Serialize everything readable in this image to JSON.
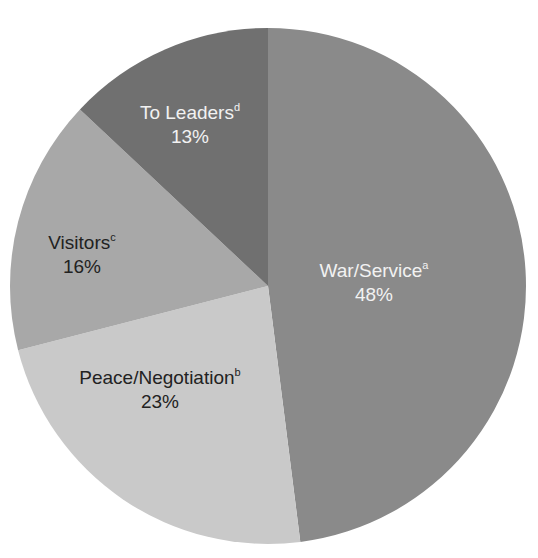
{
  "chart_data": {
    "type": "pie",
    "title": "",
    "start_angle_deg": 0,
    "direction": "clockwise",
    "slices": [
      {
        "label": "War/Service",
        "footnote": "a",
        "value": 48,
        "display": "48%",
        "color": "#8a8a8a",
        "text_color": "#f2f2f2",
        "label_pos": [
          374,
          283
        ]
      },
      {
        "label": "Peace/Negotiation",
        "footnote": "b",
        "value": 23,
        "display": "23%",
        "color": "#c9c9c9",
        "text_color": "#222222",
        "label_pos": [
          160,
          390
        ]
      },
      {
        "label": "Visitors",
        "footnote": "c",
        "value": 16,
        "display": "16%",
        "color": "#a8a8a8",
        "text_color": "#222222",
        "label_pos": [
          82,
          255
        ]
      },
      {
        "label": "To Leaders",
        "footnote": "d",
        "value": 13,
        "display": "13%",
        "color": "#707070",
        "text_color": "#f2f2f2",
        "label_pos": [
          190,
          125
        ]
      }
    ],
    "legend": null
  },
  "chart_geometry": {
    "cx": 268,
    "cy": 286,
    "r": 258
  }
}
